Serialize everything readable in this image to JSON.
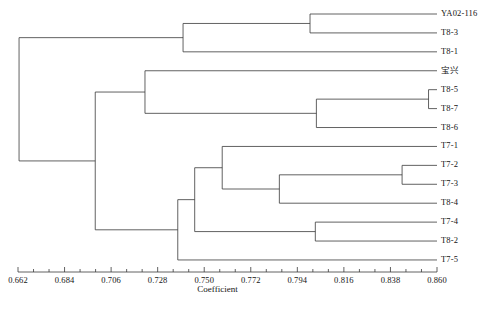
{
  "chart_data": {
    "type": "dendrogram",
    "title": "",
    "xlabel": "Coefficient",
    "ylabel": "",
    "xlim": [
      0.662,
      0.86
    ],
    "grid": false,
    "legend": "none",
    "tick_labels": [
      "0.662",
      "0.684",
      "0.706",
      "0.728",
      "0.750",
      "0.772",
      "0.794",
      "0.816",
      "0.838",
      "0.860"
    ],
    "tick_values": [
      0.662,
      0.684,
      0.706,
      0.728,
      0.75,
      0.772,
      0.794,
      0.816,
      0.838,
      0.86
    ],
    "minor_ticks_per_interval": 2,
    "leaves": [
      {
        "name": "YA02-116",
        "row": 0
      },
      {
        "name": "T8-3",
        "row": 1
      },
      {
        "name": "T8-1",
        "row": 2
      },
      {
        "name": "宝兴",
        "row": 3
      },
      {
        "name": "T8-5",
        "row": 4
      },
      {
        "name": "T8-7",
        "row": 5
      },
      {
        "name": "T8-6",
        "row": 6
      },
      {
        "name": "T7-1",
        "row": 7
      },
      {
        "name": "T7-2",
        "row": 8
      },
      {
        "name": "T7-3",
        "row": 9
      },
      {
        "name": "T8-4",
        "row": 10
      },
      {
        "name": "T7-4",
        "row": 11
      },
      {
        "name": "T8-2",
        "row": 12
      },
      {
        "name": "T7-5",
        "row": 13
      }
    ],
    "merges": [
      {
        "id": "n1",
        "coefficient": 0.8,
        "children": [
          "YA02-116",
          "T8-3"
        ]
      },
      {
        "id": "n2",
        "coefficient": 0.74,
        "children": [
          "n1",
          "T8-1"
        ]
      },
      {
        "id": "n3",
        "coefficient": 0.856,
        "children": [
          "T8-5",
          "T8-7"
        ]
      },
      {
        "id": "n4",
        "coefficient": 0.803,
        "children": [
          "n3",
          "T8-6"
        ]
      },
      {
        "id": "n5",
        "coefficient": 0.722,
        "children": [
          "宝兴",
          "n4"
        ]
      },
      {
        "id": "n6",
        "coefficient": 0.8435,
        "children": [
          "T7-2",
          "T7-3"
        ]
      },
      {
        "id": "n7",
        "coefficient": 0.7855,
        "children": [
          "n6",
          "T8-4"
        ]
      },
      {
        "id": "n8",
        "coefficient": 0.7585,
        "children": [
          "T7-1",
          "n7"
        ]
      },
      {
        "id": "n9",
        "coefficient": 0.8025,
        "children": [
          "T7-4",
          "T8-2"
        ]
      },
      {
        "id": "n10",
        "coefficient": 0.7455,
        "children": [
          "n8",
          "n9"
        ]
      },
      {
        "id": "n11",
        "coefficient": 0.7375,
        "children": [
          "n10",
          "T7-5"
        ]
      },
      {
        "id": "n12",
        "coefficient": 0.6985,
        "children": [
          "n5",
          "n11"
        ]
      },
      {
        "id": "n13",
        "coefficient": 0.6625,
        "children": [
          "n2",
          "n12"
        ]
      }
    ]
  },
  "geometry": {
    "axis_x_min_px": 18,
    "axis_x_max_px": 437,
    "axis_y_px": 272,
    "row0_y_px": 14,
    "row_step_px": 18.92,
    "label_offset_px": 4,
    "tick_major_len_px": 5,
    "tick_minor_len_px": 3,
    "axis_title_y_px": 284,
    "tick_label_y_px": 276
  },
  "style": {
    "line_color": "#3a3a3a",
    "line_width": 0.8,
    "text_color": "#141414",
    "background": "#ffffff"
  }
}
